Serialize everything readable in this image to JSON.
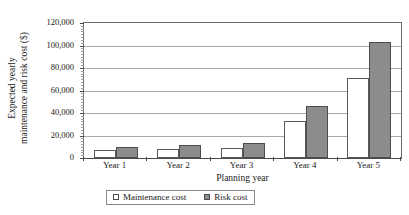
{
  "chart_data": {
    "type": "bar",
    "title": "",
    "xlabel": "Planning year",
    "ylabel": "Expected yearly maintenance and risk cost ($)",
    "ylabel_line1": "Expected yearly",
    "ylabel_line2": "maintenance and risk cost ($)",
    "categories": [
      "Year 1",
      "Year 2",
      "Year 3",
      "Year 4",
      "Year 5"
    ],
    "series": [
      {
        "name": "Maintenance cost",
        "color": "#ffffff",
        "values": [
          7000,
          8000,
          9000,
          33000,
          71000
        ]
      },
      {
        "name": "Risk cost",
        "color": "#8c8c8c",
        "values": [
          10000,
          11500,
          13500,
          46000,
          103000
        ]
      }
    ],
    "ylim": [
      0,
      120000
    ],
    "ytick_values": [
      0,
      20000,
      40000,
      60000,
      80000,
      100000,
      120000
    ],
    "ytick_labels": [
      "0",
      "20,000",
      "40,000",
      "60,000",
      "80,000",
      "100,000",
      "120,000"
    ],
    "grid": true,
    "grid_axis": "y",
    "legend_position": "bottom"
  },
  "legend": {
    "entries": [
      {
        "label": "Maintenance cost",
        "swatch": "hollow-square-swatch"
      },
      {
        "label": "Risk cost",
        "swatch": "filled-square-swatch"
      }
    ]
  }
}
